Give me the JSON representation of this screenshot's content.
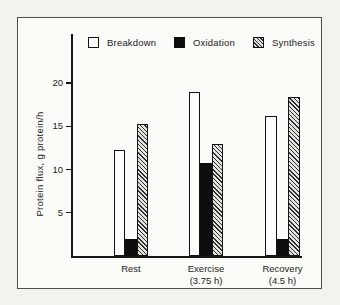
{
  "chart_data": {
    "type": "bar",
    "title": "",
    "xlabel": "",
    "ylabel": "Protein flux, g protein/h",
    "categories": [
      "Rest",
      "Exercise (3.75 h)",
      "Recovery (4.5 h)"
    ],
    "category_lines": [
      [
        "Rest"
      ],
      [
        "Exercise",
        "(3.75 h)"
      ],
      [
        "Recovery",
        "(4.5 h)"
      ]
    ],
    "series": [
      {
        "name": "Breakdown",
        "style": "open",
        "values": [
          12.2,
          19.0,
          16.2
        ]
      },
      {
        "name": "Oxidation",
        "style": "solid",
        "values": [
          2.0,
          10.7,
          2.0
        ]
      },
      {
        "name": "Synthesis",
        "style": "hatched",
        "values": [
          15.3,
          13.0,
          18.4
        ]
      }
    ],
    "yticks": [
      5,
      10,
      15,
      20
    ],
    "ylim": [
      0,
      22
    ],
    "grid": false,
    "legend_position": "top-inside"
  },
  "colors": {
    "ink": "#161616",
    "paper": "#f2f2ee",
    "panel": "#fbfbf8",
    "frame_border": "#4e4e4c"
  }
}
